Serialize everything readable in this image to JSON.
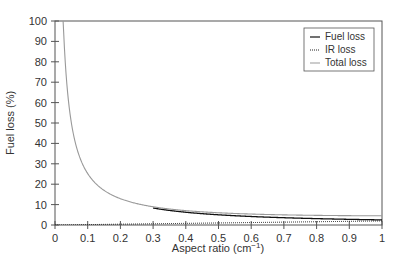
{
  "chart_data": {
    "type": "line",
    "title": "",
    "xlabel": "Aspect ratio (cm⁻¹)",
    "ylabel": "Fuel loss (%)",
    "xlim": [
      0,
      1
    ],
    "ylim": [
      0,
      100
    ],
    "x_ticks": [
      "0",
      "0.1",
      "0.2",
      "0.3",
      "0.4",
      "0.5",
      "0.6",
      "0.7",
      "0.8",
      "0.9",
      "1"
    ],
    "y_ticks": [
      "0",
      "10",
      "20",
      "30",
      "40",
      "50",
      "60",
      "70",
      "80",
      "90",
      "100"
    ],
    "grid": false,
    "legend_position": "upper right",
    "x": [
      0.01,
      0.02,
      0.03,
      0.05,
      0.075,
      0.1,
      0.15,
      0.2,
      0.3,
      0.4,
      0.5,
      0.6,
      0.7,
      0.8,
      0.9,
      1.0
    ],
    "series": [
      {
        "name": "Fuel loss",
        "style": "solid",
        "color": "#111111",
        "values": [
          250,
          125,
          83.3,
          50,
          33.3,
          25,
          16.7,
          12.5,
          8.3,
          6.3,
          5.0,
          4.2,
          3.6,
          3.1,
          2.8,
          2.5
        ]
      },
      {
        "name": "IR loss",
        "style": "dotted",
        "color": "#222222",
        "values": [
          0.02,
          0.04,
          0.06,
          0.1,
          0.15,
          0.2,
          0.3,
          0.4,
          0.6,
          0.8,
          1.0,
          1.2,
          1.4,
          1.6,
          1.8,
          2.0
        ]
      },
      {
        "name": "Total loss",
        "style": "solid",
        "color": "#999999",
        "values": [
          250,
          125,
          83.4,
          50.1,
          33.5,
          25.2,
          17.0,
          12.9,
          8.9,
          7.1,
          6.0,
          5.4,
          5.0,
          4.7,
          4.6,
          4.5
        ]
      }
    ]
  },
  "legend": {
    "items": [
      {
        "label": "Fuel loss"
      },
      {
        "label": "IR loss"
      },
      {
        "label": "Total loss"
      }
    ]
  },
  "axes": {
    "xlabel_main": "Aspect ratio (cm",
    "xlabel_sup": "−1",
    "xlabel_end": ")",
    "ylabel": "Fuel loss (%)"
  }
}
